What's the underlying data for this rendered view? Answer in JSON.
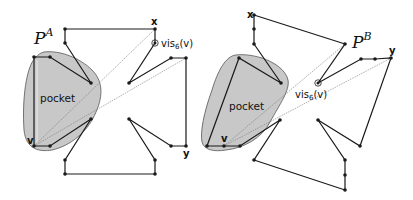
{
  "colors": {
    "stroke": "#1a1a1a",
    "pocket_fill": "#c8c8c8",
    "pocket_stroke": "#555555",
    "sightline": "#777777",
    "background": "#ffffff"
  },
  "panels": [
    {
      "id": "A",
      "polygon_label": "P",
      "polygon_sup": "A",
      "pocket_label": "pocket",
      "vertex_labels": {
        "x": "x",
        "y": "y",
        "v": "v"
      },
      "vis_label": "vis",
      "vis_sub": "6",
      "vis_arg": "(v)"
    },
    {
      "id": "B",
      "polygon_label": "P",
      "polygon_sup": "B",
      "pocket_label": "pocket",
      "vertex_labels": {
        "x": "x",
        "y": "y",
        "v": "v"
      },
      "vis_label": "vis",
      "vis_sub": "6",
      "vis_arg": "(v)"
    }
  ]
}
